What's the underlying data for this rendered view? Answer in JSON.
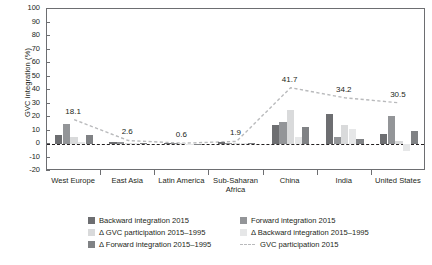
{
  "chart_data": {
    "type": "bar",
    "title": "",
    "xlabel": "",
    "ylabel": "GVC integration (%)",
    "ylim": [
      -20,
      100
    ],
    "ytick_step": 10,
    "yticks": [
      100,
      90,
      80,
      70,
      60,
      50,
      40,
      30,
      20,
      10,
      0,
      -10,
      -20
    ],
    "grid": false,
    "legend_position": "bottom",
    "categories": [
      "West Europe",
      "East Asia",
      "Latin America",
      "Sub-Saharan Africa",
      "China",
      "India",
      "United States"
    ],
    "series": [
      {
        "name": "Backward integration 2015",
        "color": "#6d6e71",
        "values": [
          6.5,
          1.2,
          0.6,
          1.4,
          14.0,
          22.5,
          7.5
        ]
      },
      {
        "name": "Forward integration 2015",
        "color": "#939598",
        "values": [
          15.0,
          1.5,
          0.5,
          1.0,
          16.5,
          5.0,
          20.5
        ]
      },
      {
        "name": "Δ GVC participation 2015–1995",
        "color": "#d9dadb",
        "values": [
          5.5,
          1.0,
          0.4,
          0.8,
          25.0,
          14.0,
          2.0
        ]
      },
      {
        "name": "Δ Backward integration 2015–1995",
        "color": "#e6e7e8",
        "values": [
          1.5,
          0.6,
          0.3,
          0.5,
          5.0,
          11.0,
          -5.0
        ]
      },
      {
        "name": "Δ Forward integration 2015–1995",
        "color": "#808285",
        "values": [
          7.0,
          0.8,
          0.2,
          1.0,
          12.5,
          3.5,
          9.5
        ]
      }
    ],
    "line_series": {
      "name": "GVC participation 2015",
      "style": "dashed",
      "color": "#b9babc",
      "values": [
        18.1,
        2.6,
        0.6,
        1.9,
        41.7,
        34.2,
        30.5
      ],
      "labels": [
        "18.1",
        "2.6",
        "0.6",
        "1.9",
        "41.7",
        "34.2",
        "30.5"
      ]
    }
  },
  "axis": {
    "y_title": "GVC integration (%)"
  },
  "legend": {
    "items": [
      {
        "label": "Backward integration 2015",
        "swatch": "#6d6e71",
        "kind": "swatch"
      },
      {
        "label": "Forward integration 2015",
        "swatch": "#939598",
        "kind": "swatch"
      },
      {
        "label": "Δ GVC participation 2015–1995",
        "swatch": "#d9dadb",
        "kind": "swatch"
      },
      {
        "label": "Δ Backward integration 2015–1995",
        "swatch": "#e6e7e8",
        "kind": "swatch"
      },
      {
        "label": "Δ Forward integration 2015–1995",
        "swatch": "#808285",
        "kind": "swatch"
      },
      {
        "label": "GVC participation 2015",
        "swatch": "#b9babc",
        "kind": "line"
      }
    ]
  }
}
